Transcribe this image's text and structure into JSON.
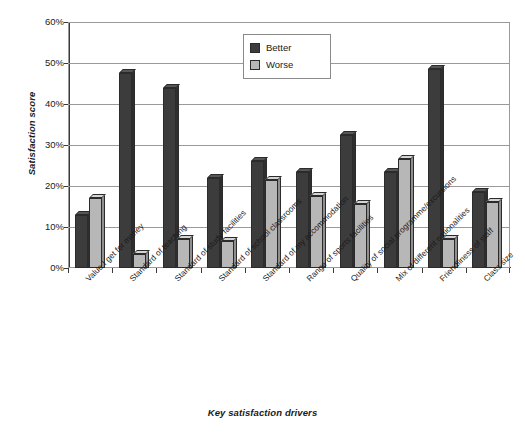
{
  "chart_data": {
    "type": "bar",
    "title": "",
    "xlabel": "Key satisfaction drivers",
    "ylabel": "Satisfaction score",
    "ylim": [
      0,
      60
    ],
    "ytick_labels": [
      "0%",
      "10%",
      "20%",
      "30%",
      "40%",
      "50%",
      "60%"
    ],
    "ytick_values": [
      0,
      10,
      20,
      30,
      40,
      50,
      60
    ],
    "grid": true,
    "legend_position": "top-center",
    "categories": [
      "Value I get for money",
      "Standard of teaching",
      "Standard of study facilities",
      "Standard of school classrooms",
      "Standard of my accommodation",
      "Range of sports facilities",
      "Quality of social programme/excursions",
      "Mix of different nationalities",
      "Friendliness of staff",
      "Class size"
    ],
    "series": [
      {
        "name": "Better",
        "color": "#3c3c3c",
        "values": [
          13,
          47.5,
          44,
          22,
          26,
          23.5,
          32.5,
          23.5,
          48.5,
          18.5
        ]
      },
      {
        "name": "Worse",
        "color": "#b7b7b7",
        "values": [
          17,
          3.5,
          7,
          6.5,
          21.5,
          17.5,
          15.5,
          26.5,
          7,
          16
        ]
      }
    ]
  }
}
